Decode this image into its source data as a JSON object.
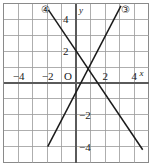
{
  "figure": {
    "kind": "coordinate-plane-graph",
    "width": 152,
    "height": 166,
    "background": "#ffffff",
    "frame_color": "#8a8a8a",
    "grid_color": "#9a9a9a",
    "axis_color": "#5a5a5a",
    "line_color": "#1a1a1a",
    "text_color": "#1a1a1a"
  },
  "axes": {
    "x_label": "x",
    "y_label": "y",
    "origin_label": "O",
    "x_min": -5,
    "x_max": 5,
    "y_min": -5,
    "y_max": 5,
    "grid_step": 1,
    "x_ticks": [
      {
        "value": -4,
        "text": "−4"
      },
      {
        "value": -2,
        "text": "−2"
      },
      {
        "value": 2,
        "text": "2"
      },
      {
        "value": 4,
        "text": "4"
      }
    ],
    "y_ticks": [
      {
        "value": 4,
        "text": "4"
      },
      {
        "value": 2,
        "text": "2"
      },
      {
        "value": -2,
        "text": "−2"
      },
      {
        "value": -4,
        "text": "−4"
      }
    ]
  },
  "chart_data": {
    "type": "line",
    "title": "",
    "xlabel": "x",
    "ylabel": "y",
    "xlim": [
      -5,
      5
    ],
    "ylim": [
      -5,
      5
    ],
    "grid": true,
    "legend": "inline-circled-labels",
    "series": [
      {
        "name": "④",
        "label_text": "④",
        "description": "descending line",
        "slope": -1.35,
        "intercept": 2.0,
        "x": [
          -1.9,
          4.6
        ],
        "y": [
          4.6,
          -4.2
        ],
        "label_position": {
          "x": -2.05,
          "y": 4.55
        }
      },
      {
        "name": "③",
        "label_text": "③",
        "description": "ascending line",
        "slope": 1.75,
        "intercept": -0.55,
        "x": [
          -1.95,
          3.1
        ],
        "y": [
          -4.0,
          4.85
        ],
        "label_position": {
          "x": 3.45,
          "y": 4.55
        }
      }
    ]
  }
}
